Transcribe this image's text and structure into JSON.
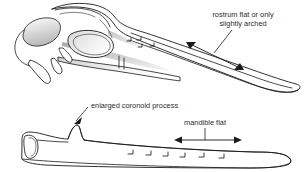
{
  "figure": {
    "background_color": "#ffffff",
    "ink_color": "#1a1a1a",
    "text_color": "#2b2b2b",
    "width": 308,
    "height": 172
  },
  "annotations": {
    "rostrum": {
      "line1": "rostrum flat or only",
      "line2": "slightly arched",
      "arrow_type": "double-headed"
    },
    "coronoid": {
      "label": "enlarged coronoid process",
      "arrow_type": "single-headed"
    },
    "mandible": {
      "label": "mandible flat",
      "arrow_type": "double-headed"
    }
  },
  "specimens": {
    "upper": {
      "name": "skull",
      "parts": [
        "cranium",
        "orbit",
        "nares",
        "rostrum",
        "upper-mandible-tip"
      ]
    },
    "lower": {
      "name": "mandible",
      "parts": [
        "coronoid-process",
        "mandibular-ramus",
        "mandible-tip"
      ],
      "tooth_mark_count": 6
    }
  }
}
